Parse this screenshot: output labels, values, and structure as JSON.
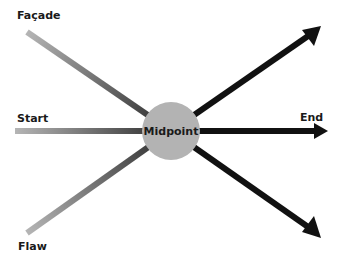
{
  "diagram": {
    "center": {
      "label": "Midpoint",
      "color": "#b3b3b3"
    },
    "inputs": [
      {
        "label": "Façade",
        "position": "top-left"
      },
      {
        "label": "Start",
        "position": "left"
      },
      {
        "label": "Flaw",
        "position": "bottom-left"
      }
    ],
    "outputs": [
      {
        "label": "",
        "position": "top-right"
      },
      {
        "label": "End",
        "position": "right"
      },
      {
        "label": "",
        "position": "bottom-right"
      }
    ],
    "colors": {
      "line_start": "#b0b0b0",
      "line_mid": "#6e6e6e",
      "line_end": "#0a0a0a"
    }
  }
}
